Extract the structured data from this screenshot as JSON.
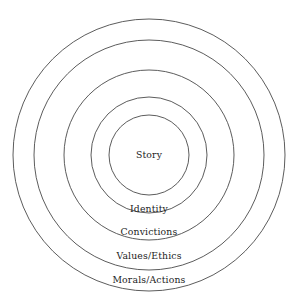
{
  "diagram": {
    "type": "concentric-circles",
    "background_color": "#ffffff",
    "stroke_color": "#4a4a4a",
    "text_color": "#1c1c1c",
    "center": {
      "x": 149,
      "y": 155
    },
    "center_label": "Story",
    "rings": [
      {
        "label": "Story",
        "radius": 40,
        "label_x": 149,
        "label_y": 158,
        "position": "center"
      },
      {
        "label": "Identity",
        "radius": 58,
        "label_x": 149,
        "label_y": 212,
        "position": "bottom-inside"
      },
      {
        "label": "Convictions",
        "radius": 85,
        "label_x": 149,
        "label_y": 235,
        "position": "bottom-inside"
      },
      {
        "label": "Values/Ethics",
        "radius": 115,
        "label_x": 149,
        "label_y": 259,
        "position": "bottom-inside"
      },
      {
        "label": "Morals/Actions",
        "radius": 136,
        "label_x": 149,
        "label_y": 283,
        "position": "bottom-inside"
      }
    ]
  }
}
